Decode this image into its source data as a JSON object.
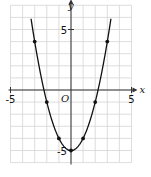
{
  "chart_data": {
    "type": "line",
    "title": "",
    "equation": "y = x^2 - 5",
    "xlabel": "x",
    "ylabel": "y",
    "origin_label": "O",
    "xlim": [
      -5,
      5
    ],
    "ylim": [
      -5,
      5
    ],
    "grid_x_range": [
      -5,
      5
    ],
    "grid_y_range": [
      -6,
      7
    ],
    "grid": true,
    "x_tick_labels": [
      {
        "value": -5,
        "label": "-5"
      },
      {
        "value": 5,
        "label": "5"
      }
    ],
    "y_tick_labels": [
      {
        "value": 5,
        "label": "5"
      },
      {
        "value": -5,
        "label": "-5"
      }
    ],
    "points": [
      {
        "x": -3,
        "y": 4
      },
      {
        "x": -2,
        "y": -1
      },
      {
        "x": -1,
        "y": -4
      },
      {
        "x": 0,
        "y": -5
      },
      {
        "x": 1,
        "y": -4
      },
      {
        "x": 2,
        "y": -1
      },
      {
        "x": 3,
        "y": 4
      }
    ],
    "curve_x_range": [
      -3.3,
      3.3
    ]
  }
}
